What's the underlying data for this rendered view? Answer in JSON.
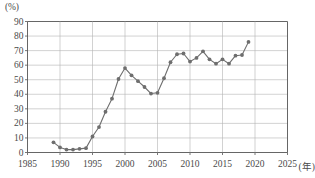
{
  "chart_data": {
    "type": "line",
    "title": "",
    "subtitle": "",
    "xlabel": "(年)",
    "ylabel": "(%)",
    "unit_label": "(%)",
    "x_axis_unit_label": "(年)",
    "xlim": [
      1985,
      2025
    ],
    "ylim": [
      0,
      90
    ],
    "grid": true,
    "legend": "none",
    "marker": "filled-circle",
    "line_color": "#6e6e6e",
    "marker_color": "#6e6e6e",
    "grid_color": "#b4b4b4",
    "axis_color": "#555555",
    "y_ticks": [
      0,
      10,
      20,
      30,
      40,
      50,
      60,
      70,
      80,
      90
    ],
    "y_tick_labels": [
      "0",
      "10",
      "20",
      "30",
      "40",
      "50",
      "60",
      "70",
      "80",
      "90"
    ],
    "x_ticks": [
      1985,
      1990,
      1995,
      2000,
      2005,
      2010,
      2015,
      2020,
      2025
    ],
    "x_tick_labels": [
      "1985",
      "1990",
      "1995",
      "2000",
      "2005",
      "2010",
      "2015",
      "2020",
      "2025"
    ],
    "x": [
      1989,
      1990,
      1991,
      1992,
      1993,
      1994,
      1995,
      1996,
      1997,
      1998,
      1999,
      2000,
      2001,
      2002,
      2003,
      2004,
      2005,
      2006,
      2007,
      2008,
      2009,
      2010,
      2011,
      2012,
      2013,
      2014,
      2015,
      2016,
      2017,
      2018,
      2019
    ],
    "values": [
      7,
      3.5,
      2,
      2,
      2.5,
      3,
      11,
      17.5,
      28,
      37,
      50.5,
      58,
      53,
      49,
      45,
      40.5,
      41,
      51,
      62,
      67.5,
      68,
      62.5,
      65,
      69.5,
      64,
      61,
      64,
      61,
      66.5,
      67,
      76
    ],
    "series": [
      {
        "name": "割合",
        "values": [
          7,
          3.5,
          2,
          2,
          2.5,
          3,
          11,
          17.5,
          28,
          37,
          50.5,
          58,
          53,
          49,
          45,
          40.5,
          41,
          51,
          62,
          67.5,
          68,
          62.5,
          65,
          69.5,
          64,
          61,
          64,
          61,
          66.5,
          67,
          76
        ]
      }
    ]
  }
}
